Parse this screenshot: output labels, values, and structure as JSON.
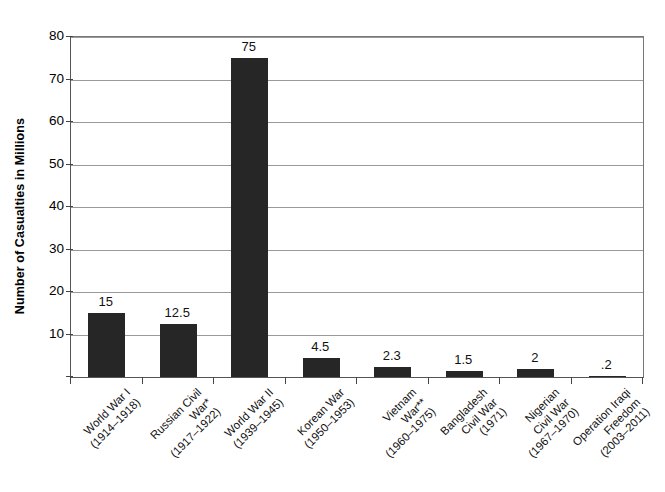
{
  "chart_data": {
    "type": "bar",
    "title": "",
    "subtitle": "",
    "xlabel": "",
    "ylabel": "Number of Casualties in Millions",
    "ylim": [
      0,
      80
    ],
    "yticks": [
      10,
      20,
      30,
      40,
      50,
      60,
      70,
      80
    ],
    "ytick_labels": [
      "10",
      "20",
      "30",
      "40",
      "50",
      "60",
      "70",
      "80"
    ],
    "grid": true,
    "legend": null,
    "categories": [
      "World War I\n(1914–1918)",
      "Russian Civil\nWar*\n(1917–1922)",
      "World War II\n(1939–1945)",
      "Korean War\n(1950–1953)",
      "Vietnam\nWar**\n(1960–1975)",
      "Bangladesh\nCivil War\n(1971)",
      "Nigerian\nCivil War\n(1967–1970)",
      "Operation Iraqi\nFreedom\n(2003–2011)"
    ],
    "values": [
      15,
      12.5,
      75,
      4.5,
      2.3,
      1.5,
      2,
      0.2
    ],
    "value_labels": [
      "15",
      "12.5",
      "75",
      "4.5",
      "2.3",
      "1.5",
      "2",
      ".2"
    ],
    "bar_color": "#262626",
    "gridline_color": "#9a9a9a",
    "axis_color": "#555555",
    "background_color": "#ffffff"
  }
}
